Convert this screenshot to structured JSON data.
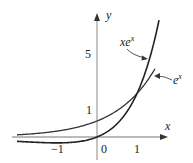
{
  "chart_data": {
    "type": "line",
    "title": "",
    "xlabel": "x",
    "ylabel": "y",
    "xlim": [
      -2.05,
      1.75
    ],
    "ylim": [
      -0.5,
      7.6
    ],
    "grid": false,
    "x_ticks": [
      "-1",
      "0",
      "1"
    ],
    "y_ticks": [
      "1",
      "5"
    ],
    "series": [
      {
        "name": "xe^x",
        "label_base": "xe",
        "label_sup": "x",
        "function": "x*exp(x)",
        "x": [
          -2,
          -1.5,
          -1,
          -0.5,
          0,
          0.5,
          1,
          1.25,
          1.55
        ],
        "values": [
          -0.27,
          -0.33,
          -0.37,
          -0.3,
          0,
          0.82,
          2.72,
          4.36,
          7.31
        ]
      },
      {
        "name": "e^x",
        "label_base": "e",
        "label_sup": "x",
        "function": "exp(x)",
        "x": [
          -2,
          -1.5,
          -1,
          -0.5,
          0,
          0.5,
          1,
          1.25,
          1.45
        ],
        "values": [
          0.14,
          0.22,
          0.37,
          0.61,
          1,
          1.65,
          2.72,
          3.49,
          4.26
        ]
      }
    ],
    "annotations": [
      {
        "text": "xe^x",
        "points_to": "xe^x curve near x=1.25"
      },
      {
        "text": "e^x",
        "points_to": "e^x curve near x=1.4"
      }
    ],
    "intersection": {
      "x": 1,
      "y": 2.718
    }
  },
  "labels": {
    "x_axis": "x",
    "y_axis": "y",
    "tick_neg1": "−1",
    "tick_0": "0",
    "tick_1": "1",
    "ytick_1": "1",
    "ytick_5": "5",
    "xex_base": "xe",
    "xex_sup": "x",
    "ex_base": "e",
    "ex_sup": "x"
  }
}
